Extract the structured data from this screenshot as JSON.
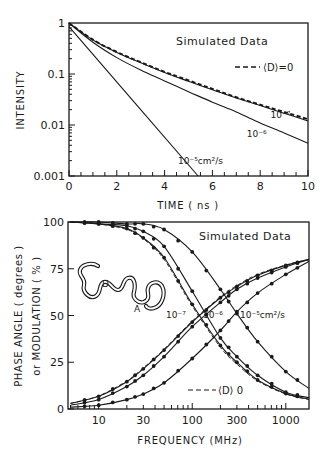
{
  "chart_data": [
    {
      "type": "line",
      "title": "",
      "annotation": "Simulated Data",
      "xlabel": "TIME (ns)",
      "ylabel": "INTENSITY",
      "xscale": "linear",
      "yscale": "log",
      "xlim": [
        0,
        10
      ],
      "ylim": [
        0.001,
        1
      ],
      "x_ticks": [
        0,
        2,
        4,
        6,
        8,
        10
      ],
      "x_tick_labels": [
        "0",
        "2",
        "4",
        "6",
        "8",
        "10"
      ],
      "y_ticks": [
        1,
        0.1,
        0.01,
        0.001
      ],
      "y_tick_labels": [
        "1",
        "0.1",
        "0.01",
        "0.001"
      ],
      "grid": false,
      "legend": [
        {
          "label": "--- ⟨D⟩=0",
          "style": "dashed"
        }
      ],
      "x": [
        0,
        1,
        2,
        3,
        4,
        5,
        6,
        7,
        8,
        9,
        10
      ],
      "series": [
        {
          "name": "<D>=0",
          "style": "dashed",
          "values": [
            1,
            0.47,
            0.27,
            0.17,
            0.11,
            0.075,
            0.051,
            0.035,
            0.025,
            0.018,
            0.013
          ]
        },
        {
          "name": "10^-7",
          "style": "solid",
          "label": "10⁻⁷",
          "values": [
            1,
            0.465,
            0.265,
            0.166,
            0.107,
            0.072,
            0.049,
            0.034,
            0.024,
            0.017,
            0.012
          ]
        },
        {
          "name": "10^-6",
          "style": "solid",
          "label": "10⁻⁶",
          "values": [
            1,
            0.42,
            0.21,
            0.12,
            0.073,
            0.045,
            0.028,
            0.018,
            0.011,
            0.007,
            0.0044
          ]
        },
        {
          "name": "10^-5 cm2/s",
          "style": "solid",
          "label": "10⁻⁵cm²/s",
          "values": [
            0.85,
            0.23,
            0.067,
            0.02,
            0.0058,
            0.0018,
            null,
            null,
            null,
            null,
            null
          ]
        }
      ],
      "curve_labels": [
        {
          "text": "10⁻⁷",
          "x": 8.85,
          "y": 0.0135
        },
        {
          "text": "10⁻⁶",
          "x": 7.85,
          "y": 0.0058
        },
        {
          "text": "10⁻⁵cm²/s",
          "x": 5.5,
          "y": 0.0017
        }
      ]
    },
    {
      "type": "line",
      "title": "",
      "annotation": "Simulated Data",
      "xlabel": "FREQUENCY (MHz)",
      "ylabel": "PHASE ANGLE (degrees) or MODULATION (%)",
      "xscale": "log",
      "yscale": "linear",
      "xlim": [
        4.7,
        1770
      ],
      "ylim": [
        0,
        100
      ],
      "x_ticks": [
        10,
        30,
        100,
        300,
        1000
      ],
      "x_tick_labels": [
        "10",
        "30",
        "100",
        "300",
        "1000"
      ],
      "y_ticks": [
        0,
        25,
        50,
        75,
        100
      ],
      "y_tick_labels": [
        "0",
        "25",
        "50",
        "75",
        "100"
      ],
      "grid": false,
      "legend": [
        {
          "label": "--- ⟨D⟩ 0",
          "style": "dashed"
        }
      ],
      "x": [
        5,
        10,
        20,
        30,
        50,
        100,
        200,
        300,
        500,
        1000,
        1800
      ],
      "series": [
        {
          "name": "phase <D>=0",
          "kind": "phase",
          "style": "dashed",
          "values": [
            3,
            7,
            15,
            22,
            32,
            47,
            60,
            66,
            72,
            77,
            80
          ]
        },
        {
          "name": "phase 10^-7",
          "kind": "phase",
          "style": "solid",
          "values": [
            3,
            6.8,
            14.6,
            21.5,
            31.5,
            46.5,
            59.5,
            65.5,
            71.5,
            76.8,
            80
          ]
        },
        {
          "name": "phase 10^-6",
          "kind": "phase",
          "style": "solid",
          "values": [
            2,
            5,
            12,
            18,
            28,
            44,
            57,
            64,
            70,
            76,
            80
          ]
        },
        {
          "name": "phase 10^-5",
          "kind": "phase",
          "style": "solid",
          "values": [
            1,
            2,
            5,
            8,
            14,
            27,
            42,
            52,
            62,
            72,
            79
          ]
        },
        {
          "name": "modulation <D>=0",
          "kind": "modulation",
          "style": "dashed",
          "values": [
            100,
            99,
            96,
            91,
            80,
            55,
            33,
            24,
            15,
            8,
            5
          ]
        },
        {
          "name": "modulation 10^-7",
          "kind": "modulation",
          "style": "solid",
          "values": [
            100,
            99,
            96.5,
            91.5,
            81,
            56,
            34,
            25,
            15.5,
            8.3,
            5.2
          ]
        },
        {
          "name": "modulation 10^-6",
          "kind": "modulation",
          "style": "solid",
          "values": [
            100,
            99,
            98,
            95,
            87,
            63,
            38,
            28,
            18,
            9,
            6
          ]
        },
        {
          "name": "modulation 10^-5",
          "kind": "modulation",
          "style": "solid",
          "values": [
            100,
            100,
            99,
            99,
            96,
            84,
            64,
            51,
            36,
            20,
            11
          ]
        }
      ],
      "curve_labels": [
        {
          "text": "10⁻⁷",
          "x": 62,
          "y": 50
        },
        {
          "text": "10⁻⁶",
          "x": 145,
          "y": 50
        },
        {
          "text": "10⁻⁵cm²/s",
          "x": 330,
          "y": 50
        }
      ],
      "inset": {
        "description": "flexible polymer chain with donor D and acceptor A",
        "donor_label": "D",
        "acceptor_label": "A"
      }
    }
  ],
  "labels": {
    "top_annotation": "Simulated Data",
    "top_legend": "⟨D⟩=0",
    "top_xlabel": "TIME  ( ns )",
    "top_ylabel": "INTENSITY",
    "bottom_annotation": "Simulated Data",
    "bottom_legend": "⟨D⟩ 0",
    "bottom_xlabel": "FREQUENCY  (MHz)",
    "bottom_ylabel_1": "PHASE  ANGLE  ( degrees )",
    "bottom_ylabel_2": "or  MODULATION ( % )",
    "inset_donor": "D",
    "inset_acceptor": "A"
  }
}
